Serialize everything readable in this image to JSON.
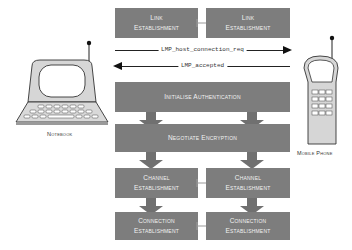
{
  "diagram": {
    "devices": {
      "left": {
        "label": "Notebook",
        "icon": "laptop-icon"
      },
      "right": {
        "label": "Mobile Phone",
        "icon": "mobile-phone-icon"
      }
    },
    "steps": {
      "link_left": {
        "line1": "Link",
        "line2": "Establishment"
      },
      "link_right": {
        "line1": "Link",
        "line2": "Establishment"
      },
      "messages": [
        {
          "label": "LMP_host_connection_req",
          "direction": "right"
        },
        {
          "label": "LMP_accepted",
          "direction": "left"
        }
      ],
      "auth": {
        "label": "Initialise Authentication"
      },
      "encrypt": {
        "label": "Negotiate Encryption"
      },
      "channel_left": {
        "line1": "Channel",
        "line2": "Establishment"
      },
      "channel_right": {
        "line1": "Channel",
        "line2": "Establishment"
      },
      "conn_left": {
        "line1": "Connection",
        "line2": "Establishment"
      },
      "conn_right": {
        "line1": "Connection",
        "line2": "Establishment"
      }
    },
    "colors": {
      "box_fill": "#7d7d7d",
      "box_text": "#f2f2f2",
      "arrow_fill": "#707070",
      "device_fill": "#d9d9d9"
    }
  }
}
